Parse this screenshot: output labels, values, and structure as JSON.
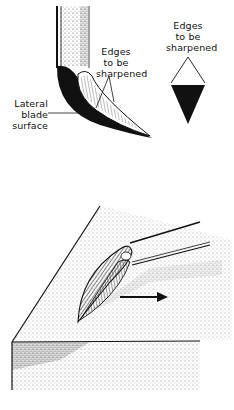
{
  "figure": {
    "top_left": {
      "title": "Curette blade side view",
      "labels": {
        "edges": [
          "Edges",
          "to be",
          "sharpened"
        ],
        "lateral": [
          "Lateral",
          "blade",
          "surface"
        ]
      }
    },
    "top_right": {
      "title": "Blade cross-section",
      "labels": {
        "edges": [
          "Edges",
          "to be",
          "sharpened"
        ]
      }
    },
    "bottom": {
      "title": "Blade on sharpening stone",
      "arrow_direction": "right"
    },
    "colors": {
      "ink": "#111111",
      "paper": "#ffffff"
    }
  }
}
